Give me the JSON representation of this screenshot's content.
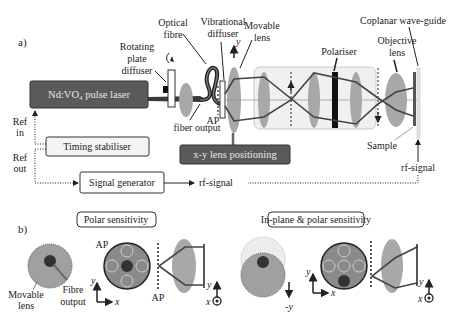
{
  "panel_a": {
    "label": "a)",
    "laser": "Nd:VO₄ pulse laser",
    "rotating_plate_diffuser": [
      "Rotating",
      "plate",
      "diffuser"
    ],
    "optical_fibre": [
      "Optical",
      "fibre"
    ],
    "vibrational_diffuser": [
      "Vibrational",
      "diffuser"
    ],
    "movable_lens": [
      "Movable",
      "lens"
    ],
    "polariser": "Polariser",
    "objective_lens": [
      "Objective",
      "lens"
    ],
    "coplanar_waveguide": "Coplanar wave-guide",
    "fiber_output": "fiber output",
    "ap": "AP",
    "sample": "Sample",
    "rf_signal_right": "rf-signal",
    "rf_signal_mid": "rf-signal",
    "timing_stabiliser": "Timing  stabiliser",
    "signal_generator": "Signal generator",
    "xy_positioning": "x-y lens positioning",
    "ref_in": [
      "Ref",
      "in"
    ],
    "ref_out": [
      "Ref",
      "out"
    ],
    "y_axis": "y"
  },
  "panel_b": {
    "label": "b)",
    "polar_sensitivity": "Polar sensitivity",
    "inplane_polar_sensitivity": "In-plane & polar sensitivity",
    "movable_lens": [
      "Movable",
      "lens"
    ],
    "fibre_output": [
      "Fibre",
      "output"
    ],
    "ap": "AP",
    "axis_x": "x",
    "axis_y": "y",
    "minus_y": "-y"
  },
  "colors": {
    "dark_box": "#5a5a5a",
    "lens_gray": "#a8a8a8",
    "beam": "#444444",
    "panel_bg": "#f0f0f0"
  }
}
